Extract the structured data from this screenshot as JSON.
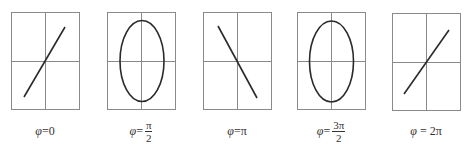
{
  "figure": {
    "colors": {
      "frame": "#8a8a8a",
      "axes": "#8a8a8a",
      "curve": "#2a2a2a",
      "text": "#333333"
    },
    "panels": [
      {
        "id": "phase-0",
        "shape": "line",
        "slope": "positive",
        "label": {
          "symbol": "φ",
          "eq": "=",
          "value": "0"
        }
      },
      {
        "id": "phase-pi-over-2",
        "shape": "ellipse",
        "label": {
          "symbol": "φ",
          "eq": "=",
          "numerator": "π",
          "denominator": "2"
        }
      },
      {
        "id": "phase-pi",
        "shape": "line",
        "slope": "negative",
        "label": {
          "symbol": "φ",
          "eq": "=",
          "value": "π"
        }
      },
      {
        "id": "phase-3pi-over-2",
        "shape": "ellipse",
        "label": {
          "symbol": "φ",
          "eq": "=",
          "numerator": "3π",
          "denominator": "2"
        }
      },
      {
        "id": "phase-2pi",
        "shape": "line",
        "slope": "positive",
        "label": {
          "symbol": "φ",
          "eq": " = ",
          "value": "2π"
        }
      }
    ]
  }
}
